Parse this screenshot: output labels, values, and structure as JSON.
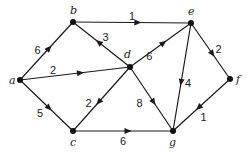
{
  "diagram": {
    "type": "directed-weighted-graph",
    "colors": {
      "ink": "#1a1a1a",
      "background": "#ffffff"
    },
    "nodes": [
      {
        "id": "a",
        "label": "a"
      },
      {
        "id": "b",
        "label": "b"
      },
      {
        "id": "c",
        "label": "c"
      },
      {
        "id": "d",
        "label": "d"
      },
      {
        "id": "e",
        "label": "e"
      },
      {
        "id": "f",
        "label": "f"
      },
      {
        "id": "g",
        "label": "g"
      }
    ],
    "edges": [
      {
        "from": "a",
        "to": "b",
        "weight": "6"
      },
      {
        "from": "a",
        "to": "d",
        "weight": "2"
      },
      {
        "from": "a",
        "to": "c",
        "weight": "5"
      },
      {
        "from": "b",
        "to": "e",
        "weight": "1"
      },
      {
        "from": "d",
        "to": "b",
        "weight": "3"
      },
      {
        "from": "d",
        "to": "e",
        "weight": "6"
      },
      {
        "from": "d",
        "to": "c",
        "weight": "2"
      },
      {
        "from": "d",
        "to": "g",
        "weight": "8"
      },
      {
        "from": "e",
        "to": "g",
        "weight": "4"
      },
      {
        "from": "e",
        "to": "f",
        "weight": "2"
      },
      {
        "from": "f",
        "to": "g",
        "weight": "1"
      },
      {
        "from": "c",
        "to": "g",
        "weight": "6"
      }
    ]
  }
}
